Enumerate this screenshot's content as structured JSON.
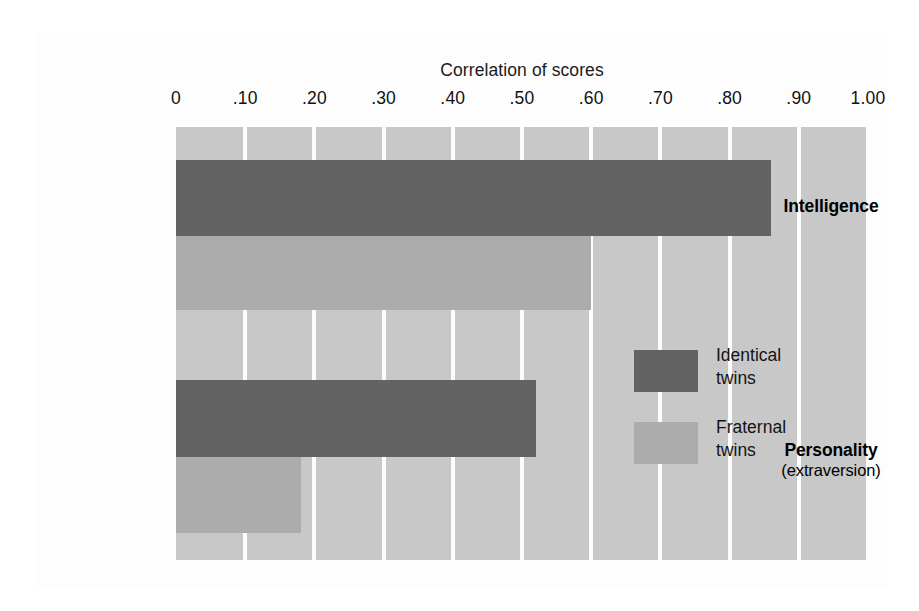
{
  "chart_data": {
    "type": "bar",
    "orientation": "horizontal",
    "title": "",
    "xlabel": "Correlation of scores",
    "ylabel": "",
    "xlim": [
      0,
      1.0
    ],
    "xticks": [
      0,
      0.1,
      0.2,
      0.3,
      0.4,
      0.5,
      0.6,
      0.7,
      0.8,
      0.9,
      1.0
    ],
    "xticklabels": [
      "0",
      ".10",
      ".20",
      ".30",
      ".40",
      ".50",
      ".60",
      ".70",
      ".80",
      ".90",
      "1.00"
    ],
    "categories": [
      "Intelligence",
      "Personality (extraversion)"
    ],
    "grid": "vertical",
    "legend_position": "inside-right-middle",
    "series": [
      {
        "name": "Identical twins",
        "color": "#636363",
        "values": [
          0.86,
          0.52
        ]
      },
      {
        "name": "Fraternal twins",
        "color": "#acacac",
        "values": [
          0.6,
          0.18
        ]
      }
    ]
  },
  "axis": {
    "title": "Correlation of scores",
    "ticks": [
      {
        "label": "0",
        "value": 0
      },
      {
        "label": ".10",
        "value": 0.1
      },
      {
        "label": ".20",
        "value": 0.2
      },
      {
        "label": ".30",
        "value": 0.3
      },
      {
        "label": ".40",
        "value": 0.4
      },
      {
        "label": ".50",
        "value": 0.5
      },
      {
        "label": ".60",
        "value": 0.6
      },
      {
        "label": ".70",
        "value": 0.7
      },
      {
        "label": ".80",
        "value": 0.8
      },
      {
        "label": ".90",
        "value": 0.9
      },
      {
        "label": "1.00",
        "value": 1.0
      }
    ]
  },
  "categories": [
    {
      "name": "Intelligence",
      "subtitle": ""
    },
    {
      "name": "Personality",
      "subtitle": "(extraversion)"
    }
  ],
  "bars": [
    {
      "group": "Intelligence",
      "series": "Identical twins",
      "value": 0.86
    },
    {
      "group": "Intelligence",
      "series": "Fraternal twins",
      "value": 0.6
    },
    {
      "group": "Personality",
      "series": "Identical twins",
      "value": 0.52
    },
    {
      "group": "Personality",
      "series": "Fraternal twins",
      "value": 0.18
    }
  ],
  "legend": {
    "items": [
      {
        "label": "Identical\ntwins",
        "color": "#636363"
      },
      {
        "label": "Fraternal\ntwins",
        "color": "#acacac"
      }
    ]
  },
  "colors": {
    "identical": "#636363",
    "fraternal": "#acacac",
    "plot_background": "#c8c8c8",
    "page_background": "#fdfdfd",
    "gridline": "#fdfdfd",
    "text": "#111111"
  }
}
